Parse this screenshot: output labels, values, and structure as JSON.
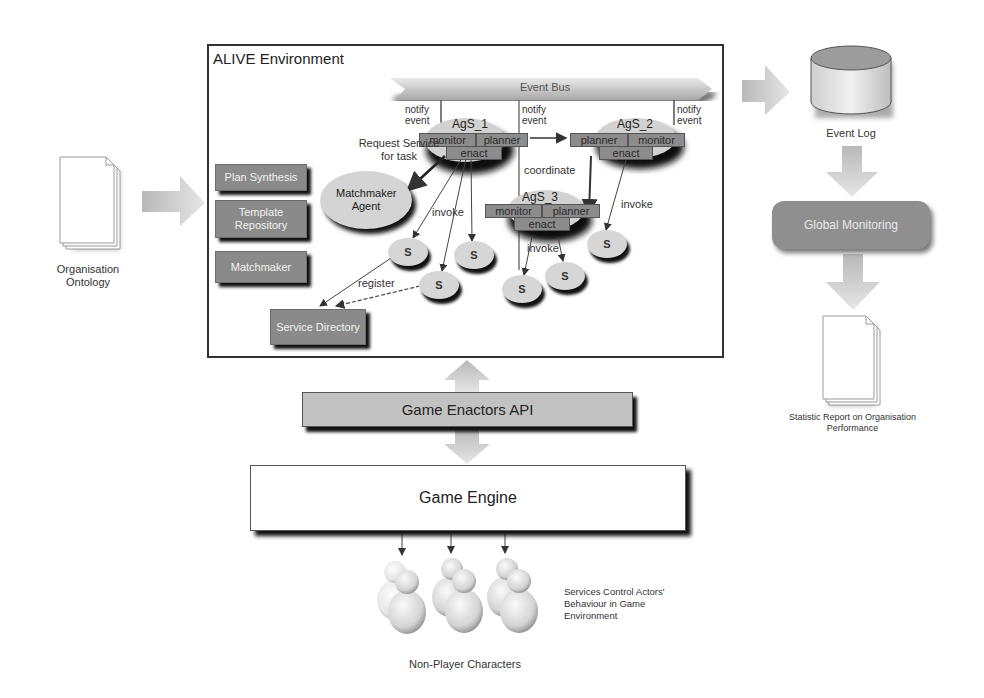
{
  "diagram": {
    "environment": {
      "title": "ALIVE Environment",
      "event_bus": "Event Bus",
      "notify_labels": [
        "notify\nevent",
        "notify\nevent",
        "notify\nevent"
      ],
      "modules": [
        "Plan Synthesis",
        "Template Repository",
        "Matchmaker"
      ],
      "service_directory": "Service Directory",
      "matchmaker_agent": "Matchmaker Agent",
      "request_label": "Request Service for task",
      "agents": [
        {
          "name": "AgS_1",
          "cells": [
            "monitor",
            "planner",
            "enact"
          ]
        },
        {
          "name": "AgS_2",
          "cells": [
            "planner",
            "monitor",
            "enact"
          ]
        },
        {
          "name": "AgS_3",
          "cells": [
            "monitor",
            "planner",
            "enact"
          ]
        }
      ],
      "edge_labels": {
        "coordinate": "coordinate",
        "invoke_1": "invoke",
        "invoke_2": "invoke",
        "invoke_3": "invoke",
        "register": "register"
      },
      "service_label": "S"
    },
    "inputs": {
      "ontology": "Organisation Ontology"
    },
    "outputs": {
      "event_log": "Event Log",
      "global_monitoring": "Global Monitoring",
      "report": "Statistic Report on Organisation Performance"
    },
    "bottom": {
      "api": "Game Enactors API",
      "engine": "Game Engine",
      "npc_label": "Non-Player Characters",
      "npc_note": "Services Control Actors' Behaviour in Game Environment"
    },
    "colors": {
      "module_fill": "#8a8a8a",
      "api_fill": "#c2c2c2",
      "shadow": "#111111",
      "arrow_fill": "#c8c8c8"
    }
  }
}
